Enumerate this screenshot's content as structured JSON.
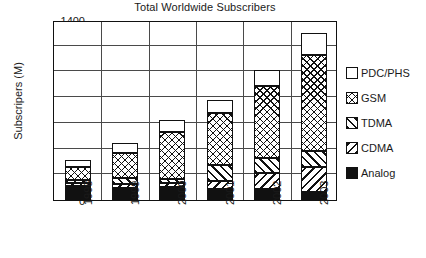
{
  "chart_data": {
    "type": "bar",
    "title": "Total Worldwide Subscribers",
    "xlabel": "",
    "ylabel": "Subscripers (M)",
    "categories": [
      "1998",
      "1999",
      "2000",
      "2001",
      "2002",
      "2003"
    ],
    "ylim": [
      0,
      1400
    ],
    "yticks": [
      0,
      200,
      400,
      600,
      800,
      1000,
      1200,
      1400
    ],
    "grid": true,
    "stacked": true,
    "legend_position": "right",
    "series": [
      {
        "name": "Analog",
        "values": [
          110,
          90,
          105,
          85,
          85,
          60
        ],
        "pattern": "solid-black"
      },
      {
        "name": "CDMA",
        "values": [
          25,
          35,
          30,
          60,
          125,
          200
        ],
        "pattern": "back-diagonal"
      },
      {
        "name": "TDMA",
        "values": [
          20,
          50,
          30,
          125,
          120,
          125
        ],
        "pattern": "forward-diagonal"
      },
      {
        "name": "GSM",
        "values": [
          105,
          190,
          365,
          405,
          560,
          745
        ],
        "pattern": "cross-hatch"
      },
      {
        "name": "PDC/PHS",
        "values": [
          50,
          80,
          90,
          105,
          120,
          170
        ],
        "pattern": "white"
      }
    ],
    "cumulative_tops": {
      "1998": {
        "Analog": 110,
        "CDMA": 135,
        "TDMA": 155,
        "GSM": 260,
        "PDC/PHS": 310
      },
      "1999": {
        "Analog": 90,
        "CDMA": 125,
        "TDMA": 175,
        "GSM": 365,
        "PDC/PHS": 445
      },
      "2000": {
        "Analog": 105,
        "CDMA": 135,
        "TDMA": 165,
        "GSM": 530,
        "PDC/PHS": 620
      },
      "2001": {
        "Analog": 85,
        "CDMA": 145,
        "TDMA": 270,
        "GSM": 675,
        "PDC/PHS": 780
      },
      "2002": {
        "Analog": 85,
        "CDMA": 210,
        "TDMA": 330,
        "GSM": 890,
        "PDC/PHS": 1010
      },
      "2003": {
        "Analog": 60,
        "CDMA": 260,
        "TDMA": 385,
        "GSM": 1130,
        "PDC/PHS": 1300
      }
    },
    "totals": [
      310,
      445,
      620,
      780,
      1010,
      1300
    ]
  },
  "legend": {
    "entries": [
      {
        "label": "PDC/PHS",
        "swatch": "white"
      },
      {
        "label": "GSM",
        "swatch": "cross-hatch"
      },
      {
        "label": "TDMA",
        "swatch": "forward-diagonal"
      },
      {
        "label": "CDMA",
        "swatch": "back-diagonal"
      },
      {
        "label": "Analog",
        "swatch": "solid-black"
      }
    ]
  },
  "colors": {
    "ink": "#111111",
    "grid": "#4a4a4a",
    "background": "#ffffff"
  }
}
